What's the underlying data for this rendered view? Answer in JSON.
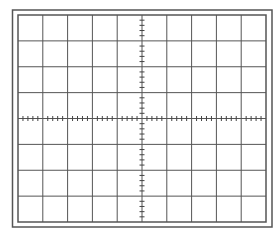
{
  "diagram": {
    "type": "oscilloscope-graticule",
    "outer_frame": {
      "x": 12.5,
      "y": 10,
      "width": 259.5,
      "height": 217
    },
    "grid": {
      "x": 18,
      "y": 15,
      "width": 248,
      "height": 207
    },
    "divisions": {
      "horizontal": 10,
      "vertical": 8
    },
    "minor_ticks_per_division": 5,
    "center_axes": {
      "x_axis_ticks": true,
      "y_axis_ticks": true
    },
    "colors": {
      "background": "#ffffff",
      "frame": "#555555",
      "grid_line": "#555555",
      "tick": "#444444"
    }
  }
}
